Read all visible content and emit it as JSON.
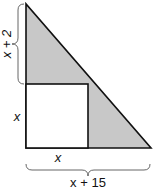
{
  "diagram": {
    "shapes": {
      "triangle": {
        "description": "right triangle, shaded gray",
        "fill": "#c8c8c8",
        "stroke": "#111111"
      },
      "square": {
        "description": "unshaded square inscribed at right angle",
        "fill": "#ffffff",
        "stroke": "#111111"
      }
    },
    "labels": {
      "top_left_brace": "x + 2",
      "square_side_vertical": "x",
      "square_side_horizontal": "x",
      "bottom_brace": "x + 15"
    }
  }
}
